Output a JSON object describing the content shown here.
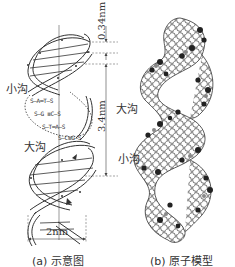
{
  "figure": {
    "panel_a": {
      "caption": "(a) 示意图",
      "labels": {
        "minor_groove": "小沟",
        "major_groove": "大沟"
      },
      "dimensions": {
        "rise": "0.34nm",
        "pitch": "3.4nm",
        "width": "2nm"
      },
      "base_pairs": [
        "S—A═T—S",
        "S—G ≡C—S",
        "S—T═A—S",
        "S—C≡G—S"
      ]
    },
    "panel_b": {
      "caption": "(b) 原子模型",
      "labels": {
        "major_groove": "大沟",
        "minor_groove": "小沟"
      }
    },
    "colors": {
      "line": "#333333",
      "dashed": "#666666",
      "atom_fill": "#ffffff",
      "atom_dark": "#222222",
      "atom_mid": "#888888"
    }
  }
}
